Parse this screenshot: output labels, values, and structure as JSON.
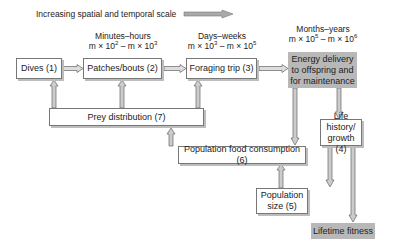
{
  "title": "Increasing spatial and temporal scale",
  "scales": [
    {
      "period": "Minutes–hours",
      "range_html": "m × 10² – m × 10³"
    },
    {
      "period": "Days–weeks",
      "range_html": "m × 10³ – m × 10⁵"
    },
    {
      "period": "Months–years",
      "range_html": "m × 10⁵ – m × 10⁶"
    }
  ],
  "nodes": {
    "dives": "Dives (1)",
    "patches": "Patches/bouts (2)",
    "foraging": "Foraging trip (3)",
    "energy": "Energy delivery to offspring and for maintenance",
    "prey": "Prey distribution (7)",
    "consumption": "Population food consumption (6)",
    "life_history": "Life history/ growth (4)",
    "pop_size": "Population size (5)",
    "fitness": "Lifetime fitness"
  },
  "colors": {
    "shade": "#b8b8b8",
    "arrow_fill": "#c8c8c8",
    "arrow_stroke": "#666666"
  }
}
